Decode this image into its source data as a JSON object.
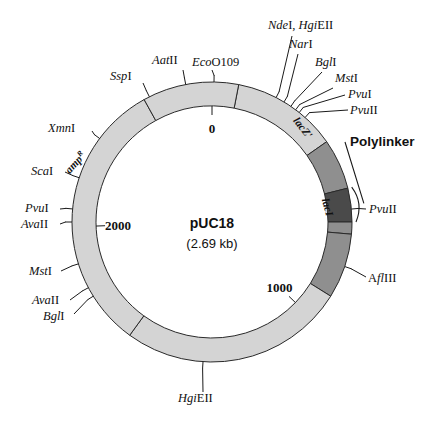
{
  "figure": {
    "name": "pUC18 plasmid restriction map",
    "plasmid_name": "pUC18",
    "plasmid_size": "(2.69 kb)"
  },
  "geometry": {
    "center_x": 212,
    "center_y": 222,
    "inner_radius": 116,
    "outer_radius": 140
  },
  "colors": {
    "backbone_light": "#d4d4d4",
    "gene_medium": "#8f8f8f",
    "polylinker_dark": "#4a4a4a",
    "outline": "#2a2a2a",
    "text": "#111111"
  },
  "coordinate_markers": [
    {
      "label": "0",
      "angle_deg": 0,
      "name": "coord-marker-0"
    },
    {
      "label": "1000",
      "angle_deg": 134,
      "name": "coord-marker-1000"
    },
    {
      "label": "2000",
      "angle_deg": 268,
      "name": "coord-marker-2000"
    }
  ],
  "segments": [
    {
      "name": "backbone-top",
      "label": "",
      "start_deg": 11,
      "end_deg": 55,
      "shade": "backbone_light"
    },
    {
      "name": "lacZ-segment",
      "label": "lacZ'",
      "start_deg": 55,
      "end_deg": 76,
      "shade": "gene_medium"
    },
    {
      "name": "polylinker-segment",
      "label": "",
      "start_deg": 76,
      "end_deg": 90,
      "shade": "polylinker_dark"
    },
    {
      "name": "lac-promoter-gap",
      "label": "",
      "start_deg": 90,
      "end_deg": 95,
      "shade": "gene_medium"
    },
    {
      "name": "lacI-segment",
      "label": "lacI",
      "start_deg": 95,
      "end_deg": 122,
      "shade": "gene_medium"
    },
    {
      "name": "backbone-right",
      "label": "",
      "start_deg": 122,
      "end_deg": 216,
      "shade": "backbone_light"
    },
    {
      "name": "ampR-segment",
      "label": "ampR",
      "start_deg": 216,
      "end_deg": 331,
      "shade": "backbone_light"
    },
    {
      "name": "backbone-left",
      "label": "",
      "start_deg": 331,
      "end_deg": 371,
      "shade": "backbone_light"
    }
  ],
  "gene_labels": [
    {
      "name": "gene-label-lacZ",
      "text": "lacZ'",
      "super": "",
      "x": 300,
      "y": 130,
      "rotate": 52
    },
    {
      "name": "gene-label-lacI",
      "text": "lacI",
      "super": "",
      "x": 324,
      "y": 208,
      "rotate": 75
    },
    {
      "name": "gene-label-ampR",
      "text": "amp",
      "super": "R",
      "x": 78,
      "y": 165,
      "rotate": -48
    }
  ],
  "polylinker": {
    "label": "Polylinker",
    "label_x": 350,
    "label_y": 146
  },
  "restriction_sites": [
    {
      "name": "site-ndeI-hgiEII",
      "parts": [
        {
          "t": "Nde",
          "s": "i"
        },
        {
          "t": "I, ",
          "s": "r"
        },
        {
          "t": "Hgi",
          "s": "i"
        },
        {
          "t": "EII",
          "s": "r"
        }
      ],
      "text": "NdeI, HgiEII",
      "label_x": 268,
      "label_y": 29,
      "anchor": "start",
      "leader": [
        [
          292,
          36
        ],
        [
          280,
          90
        ]
      ]
    },
    {
      "name": "site-narI",
      "parts": [
        {
          "t": "Nar",
          "s": "i"
        },
        {
          "t": "I",
          "s": "r"
        }
      ],
      "text": "NarI",
      "label_x": 289,
      "label_y": 48,
      "anchor": "start",
      "leader": [
        [
          298,
          54
        ],
        [
          290,
          92
        ]
      ]
    },
    {
      "name": "site-bglI-top",
      "parts": [
        {
          "t": "Bgl",
          "s": "i"
        },
        {
          "t": "I",
          "s": "r"
        }
      ],
      "text": "BglI",
      "label_x": 315,
      "label_y": 66,
      "anchor": "start",
      "leader": [
        [
          322,
          72
        ],
        [
          298,
          96
        ]
      ]
    },
    {
      "name": "site-mstI-top",
      "parts": [
        {
          "t": "Mst",
          "s": "i"
        },
        {
          "t": "I",
          "s": "r"
        }
      ],
      "text": "MstI",
      "label_x": 335,
      "label_y": 82,
      "anchor": "start",
      "leader": [
        [
          333,
          88
        ],
        [
          303,
          100
        ]
      ]
    },
    {
      "name": "site-pvuI-top",
      "parts": [
        {
          "t": "Pvu",
          "s": "i"
        },
        {
          "t": "I",
          "s": "r"
        }
      ],
      "text": "PvuI",
      "label_x": 348,
      "label_y": 98,
      "anchor": "start",
      "leader": [
        [
          345,
          95
        ],
        [
          306,
          104
        ]
      ]
    },
    {
      "name": "site-pvuII-top",
      "parts": [
        {
          "t": "Pvu",
          "s": "i"
        },
        {
          "t": "II",
          "s": "r"
        }
      ],
      "text": "PvuII",
      "label_x": 350,
      "label_y": 114,
      "anchor": "start",
      "leader": [
        [
          348,
          110
        ],
        [
          310,
          112
        ]
      ]
    },
    {
      "name": "site-ecoO109",
      "parts": [
        {
          "t": "Eco",
          "s": "i"
        },
        {
          "t": "O109",
          "s": "r"
        }
      ],
      "text": "EcoO109",
      "label_x": 192,
      "label_y": 66,
      "anchor": "start",
      "leader": [
        [
          212,
          70
        ],
        [
          214,
          82
        ]
      ]
    },
    {
      "name": "site-aatII",
      "parts": [
        {
          "t": "Aat",
          "s": "i"
        },
        {
          "t": "II",
          "s": "r"
        }
      ],
      "text": "AatII",
      "label_x": 152,
      "label_y": 64,
      "anchor": "start",
      "leader": [
        [
          183,
          70
        ],
        [
          186,
          86
        ]
      ]
    },
    {
      "name": "site-sspI",
      "parts": [
        {
          "t": "Ssp",
          "s": "i"
        },
        {
          "t": "I",
          "s": "r"
        }
      ],
      "text": "SspI",
      "label_x": 110,
      "label_y": 80,
      "anchor": "start",
      "leader": [
        [
          143,
          83
        ],
        [
          150,
          98
        ]
      ]
    },
    {
      "name": "site-xmnI",
      "parts": [
        {
          "t": "Xmn",
          "s": "i"
        },
        {
          "t": "I",
          "s": "r"
        }
      ],
      "text": "XmnI",
      "label_x": 48,
      "label_y": 132,
      "anchor": "start",
      "leader": [
        [
          92,
          131
        ],
        [
          103,
          141
        ]
      ]
    },
    {
      "name": "site-scaI",
      "parts": [
        {
          "t": "Sca",
          "s": "i"
        },
        {
          "t": "I",
          "s": "r"
        }
      ],
      "text": "ScaI",
      "label_x": 31,
      "label_y": 175,
      "anchor": "start",
      "leader": [
        [
          65,
          172
        ],
        [
          80,
          178
        ]
      ]
    },
    {
      "name": "site-pvuI-left",
      "parts": [
        {
          "t": "Pvu",
          "s": "i"
        },
        {
          "t": "I",
          "s": "r"
        }
      ],
      "text": "PvuI",
      "label_x": 25,
      "label_y": 212,
      "anchor": "start",
      "leader": [
        [
          60,
          209
        ],
        [
          73,
          209
        ]
      ]
    },
    {
      "name": "site-avaII-left",
      "parts": [
        {
          "t": "Ava",
          "s": "i"
        },
        {
          "t": "II",
          "s": "r"
        }
      ],
      "text": "AvaII",
      "label_x": 21,
      "label_y": 228,
      "anchor": "start",
      "leader": [
        [
          60,
          224
        ],
        [
          73,
          222
        ]
      ]
    },
    {
      "name": "site-mstI-left",
      "parts": [
        {
          "t": "Mst",
          "s": "i"
        },
        {
          "t": "I",
          "s": "r"
        }
      ],
      "text": "MstI",
      "label_x": 29,
      "label_y": 275,
      "anchor": "start",
      "leader": [
        [
          61,
          271
        ],
        [
          78,
          264
        ]
      ]
    },
    {
      "name": "site-avaII-bl",
      "parts": [
        {
          "t": "Ava",
          "s": "i"
        },
        {
          "t": "II",
          "s": "r"
        }
      ],
      "text": "AvaII",
      "label_x": 32,
      "label_y": 304,
      "anchor": "start",
      "leader": [
        [
          70,
          300
        ],
        [
          86,
          289
        ]
      ]
    },
    {
      "name": "site-bglI-bl",
      "parts": [
        {
          "t": "Bgl",
          "s": "i"
        },
        {
          "t": "I",
          "s": "r"
        }
      ],
      "text": "BglI",
      "label_x": 43,
      "label_y": 320,
      "anchor": "start",
      "leader": [
        [
          74,
          314
        ],
        [
          92,
          297
        ]
      ]
    },
    {
      "name": "site-hgiEII-bottom",
      "parts": [
        {
          "t": "Hgi",
          "s": "i"
        },
        {
          "t": "EII",
          "s": "r"
        }
      ],
      "text": "HgiEII",
      "label_x": 178,
      "label_y": 402,
      "anchor": "start",
      "leader": [
        [
          203,
          392
        ],
        [
          203,
          362
        ]
      ]
    },
    {
      "name": "site-aflIII",
      "parts": [
        {
          "t": "A",
          "s": "r"
        },
        {
          "t": "fl",
          "s": "i"
        },
        {
          "t": "III",
          "s": "r"
        }
      ],
      "text": "AflIII",
      "label_x": 368,
      "label_y": 282,
      "anchor": "start",
      "leader": [
        [
          366,
          277
        ],
        [
          349,
          268
        ]
      ]
    },
    {
      "name": "site-pvuII-right",
      "parts": [
        {
          "t": "Pvu",
          "s": "i"
        },
        {
          "t": "II",
          "s": "r"
        }
      ],
      "text": "PvuII",
      "label_x": 369,
      "label_y": 213,
      "anchor": "start",
      "leader": [
        [
          366,
          209
        ],
        [
          352,
          209
        ]
      ]
    }
  ]
}
